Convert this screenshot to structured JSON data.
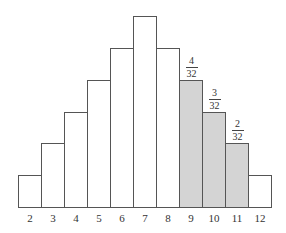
{
  "chart_data": {
    "type": "bar",
    "title": "",
    "xlabel": "",
    "ylabel": "",
    "categories": [
      "2",
      "3",
      "4",
      "5",
      "6",
      "7",
      "8",
      "9",
      "10",
      "11",
      "12"
    ],
    "values": [
      1,
      2,
      3,
      4,
      5,
      6,
      5,
      4,
      3,
      2,
      1
    ],
    "highlighted": [
      "9",
      "10",
      "11"
    ],
    "annotations": [
      {
        "category": "9",
        "numerator": "4",
        "denominator": "32"
      },
      {
        "category": "10",
        "numerator": "3",
        "denominator": "32"
      },
      {
        "category": "11",
        "numerator": "2",
        "denominator": "32"
      }
    ],
    "ylim": [
      0,
      6
    ],
    "grid": false,
    "legend": null
  },
  "colors": {
    "bar_fill": "#ffffff",
    "highlight_fill": "#d4d4d4",
    "stroke": "#555555"
  }
}
